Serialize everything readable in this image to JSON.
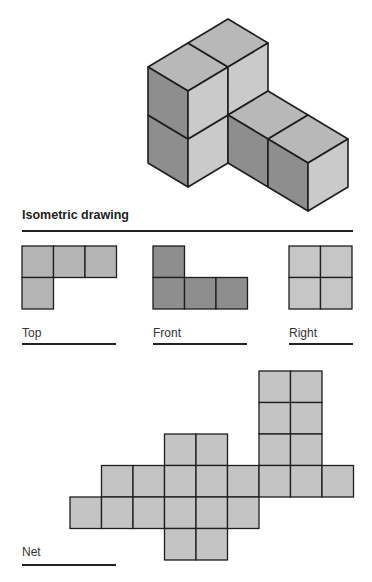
{
  "colors": {
    "top_face": "#b8b8b8",
    "left_face": "#8e8e8e",
    "front_face": "#cacaca",
    "view_top": "#b4b4b4",
    "view_front": "#8e8e8e",
    "view_right": "#c6c6c6",
    "net": "#c4c4c4",
    "stroke": "#1e1e1e"
  },
  "isometric": {
    "title": "Isometric drawing",
    "origin": [
      148,
      163
    ],
    "axis_a": [
      40,
      -24
    ],
    "axis_b": [
      40,
      24
    ],
    "axis_c": [
      0,
      -48
    ],
    "blocks": [
      {
        "name": "tall-block",
        "a": [
          0,
          2
        ],
        "b": [
          0,
          1
        ],
        "c": [
          0,
          2
        ]
      },
      {
        "name": "extension-block",
        "a": [
          1,
          2
        ],
        "b": [
          1,
          3
        ],
        "c": [
          0,
          1
        ]
      }
    ]
  },
  "views": [
    {
      "label": "Top",
      "x": 22,
      "cells": [
        [
          0,
          0
        ],
        [
          1,
          0
        ],
        [
          2,
          0
        ],
        [
          0,
          1
        ]
      ],
      "color_key": "view_top",
      "rule_width": 94
    },
    {
      "label": "Front",
      "x": 153,
      "cells": [
        [
          0,
          0
        ],
        [
          0,
          1
        ],
        [
          1,
          1
        ],
        [
          2,
          1
        ]
      ],
      "color_key": "view_front",
      "rule_width": 94
    },
    {
      "label": "Right",
      "x": 289,
      "cells": [
        [
          0,
          0
        ],
        [
          1,
          0
        ],
        [
          0,
          1
        ],
        [
          1,
          1
        ]
      ],
      "color_key": "view_right",
      "rule_width": 64
    }
  ],
  "view_cell_size": 31.5,
  "view_top_y": 246,
  "net": {
    "label": "Net",
    "cell_size": 31.5,
    "origin": [
      70,
      371
    ],
    "rows": [
      [
        6,
        7
      ],
      [
        6,
        7
      ],
      [
        3,
        4,
        6,
        7
      ],
      [
        1,
        2,
        3,
        4,
        5,
        6,
        7,
        8
      ],
      [
        0,
        1,
        2,
        3,
        4,
        5
      ],
      [
        3,
        4
      ]
    ]
  }
}
